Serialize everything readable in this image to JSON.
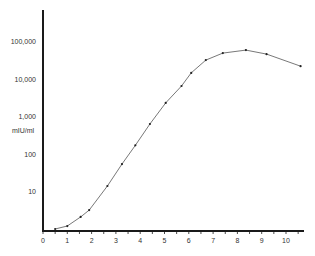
{
  "chart_data": {
    "type": "line",
    "title": "",
    "xlabel": "",
    "ylabel": "mIU/ml",
    "yscale": "log",
    "xlim": [
      0,
      10.8
    ],
    "ylim": [
      1,
      200000
    ],
    "grid": false,
    "legend": null,
    "x_ticks": [
      "0",
      "1",
      "2",
      "3",
      "4",
      "5",
      "6",
      "7",
      "8",
      "9",
      "10"
    ],
    "y_ticks": [
      "10",
      "100",
      "1,000",
      "10,000",
      "100,000"
    ],
    "series": [
      {
        "name": "hCG",
        "x": [
          0.5,
          1.0,
          1.55,
          1.9,
          2.65,
          3.25,
          3.8,
          4.4,
          5.05,
          5.7,
          6.1,
          6.7,
          7.4,
          8.35,
          9.2,
          10.6
        ],
        "values": [
          1,
          1.2,
          2.1,
          3.2,
          14,
          54,
          170,
          630,
          2300,
          6500,
          14500,
          32000,
          49000,
          59000,
          46000,
          22000
        ]
      }
    ]
  },
  "axes": {
    "ylabel": "mIU/ml",
    "x_ticks": [
      "0",
      "1",
      "2",
      "3",
      "4",
      "5",
      "6",
      "7",
      "8",
      "9",
      "10"
    ],
    "y_ticks": [
      "10",
      "100",
      "1,000",
      "10,000",
      "100,000"
    ]
  },
  "style": {
    "axis_color": "#1a1a1a",
    "line_color": "#555555",
    "marker_color": "#222222"
  }
}
